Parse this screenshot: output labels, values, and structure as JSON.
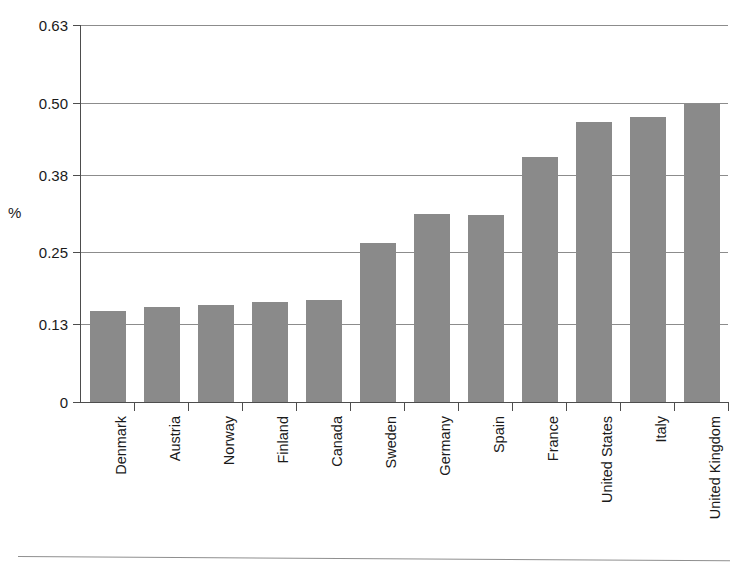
{
  "chart_data": {
    "type": "bar",
    "title": "",
    "subtitle": "",
    "xlabel": "",
    "ylabel": "%",
    "categories": [
      "Denmark",
      "Austria",
      "Norway",
      "Finland",
      "Canada",
      "Sweden",
      "Germany",
      "Spain",
      "France",
      "United States",
      "Italy",
      "United Kingdom"
    ],
    "values": [
      0.152,
      0.159,
      0.162,
      0.167,
      0.17,
      0.266,
      0.314,
      0.313,
      0.409,
      0.468,
      0.476,
      0.498
    ],
    "ylim": [
      0,
      0.63
    ],
    "yticks": [
      0,
      0.13,
      0.25,
      0.38,
      0.5,
      0.63
    ],
    "ytick_labels": [
      "0",
      "0.13",
      "0.25",
      "0.38",
      "0.50",
      "0.63"
    ],
    "grid": "horizontal",
    "legend": "none",
    "bar_color": "#8a8a8a",
    "axis_color": "#4d4d4d",
    "gridline_color": "#8c8c8c",
    "x_tick_label_rotation": "-90",
    "series": [
      {
        "name": "",
        "values": [
          0.152,
          0.159,
          0.162,
          0.167,
          0.17,
          0.266,
          0.314,
          0.313,
          0.409,
          0.468,
          0.476,
          0.498
        ]
      }
    ]
  }
}
